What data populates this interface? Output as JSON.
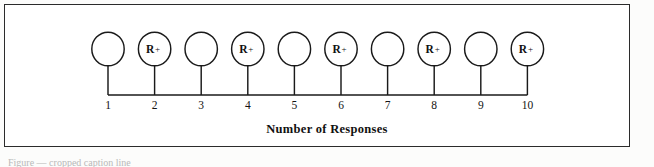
{
  "figure": {
    "axis_title": "Number of Responses",
    "frame": {
      "border_color": "#2b2b2b",
      "background": "#ffffff"
    },
    "ink_color": "#1a1a1a",
    "paper_color": "#fcfcfb"
  },
  "chart_data": {
    "type": "scatter",
    "title": "",
    "subtitle": "",
    "xlabel": "Number of Responses",
    "ylabel": "",
    "xlim": [
      1,
      10
    ],
    "grid": false,
    "legend": "none",
    "annotation": "Alternating fixed-ratio reinforcement schedule: every second response is reinforced (FR-2).",
    "categories": [
      "1",
      "2",
      "3",
      "4",
      "5",
      "6",
      "7",
      "8",
      "9",
      "10"
    ],
    "x": [
      1,
      2,
      3,
      4,
      5,
      6,
      7,
      8,
      9,
      10
    ],
    "series": [
      {
        "name": "Responses",
        "marker": "circle",
        "values": [
          1,
          1,
          1,
          1,
          1,
          1,
          1,
          1,
          1,
          1
        ]
      },
      {
        "name": "Reinforcement",
        "marker": "R+",
        "values": [
          0,
          1,
          0,
          1,
          0,
          1,
          0,
          1,
          0,
          1
        ]
      }
    ],
    "nodes": [
      {
        "index": 1,
        "tick_label": "1",
        "reinforced": false,
        "marker_text": "",
        "plus": ""
      },
      {
        "index": 2,
        "tick_label": "2",
        "reinforced": true,
        "marker_text": "R",
        "plus": "+"
      },
      {
        "index": 3,
        "tick_label": "3",
        "reinforced": false,
        "marker_text": "",
        "plus": ""
      },
      {
        "index": 4,
        "tick_label": "4",
        "reinforced": true,
        "marker_text": "R",
        "plus": "+"
      },
      {
        "index": 5,
        "tick_label": "5",
        "reinforced": false,
        "marker_text": "",
        "plus": ""
      },
      {
        "index": 6,
        "tick_label": "6",
        "reinforced": true,
        "marker_text": "R",
        "plus": "+"
      },
      {
        "index": 7,
        "tick_label": "7",
        "reinforced": false,
        "marker_text": "",
        "plus": ""
      },
      {
        "index": 8,
        "tick_label": "8",
        "reinforced": true,
        "marker_text": "R",
        "plus": "+"
      },
      {
        "index": 9,
        "tick_label": "9",
        "reinforced": false,
        "marker_text": "",
        "plus": ""
      },
      {
        "index": 10,
        "tick_label": "10",
        "reinforced": true,
        "marker_text": "R",
        "plus": "+"
      }
    ]
  },
  "caption": {
    "cropped_text": "Figure — cropped caption line"
  }
}
